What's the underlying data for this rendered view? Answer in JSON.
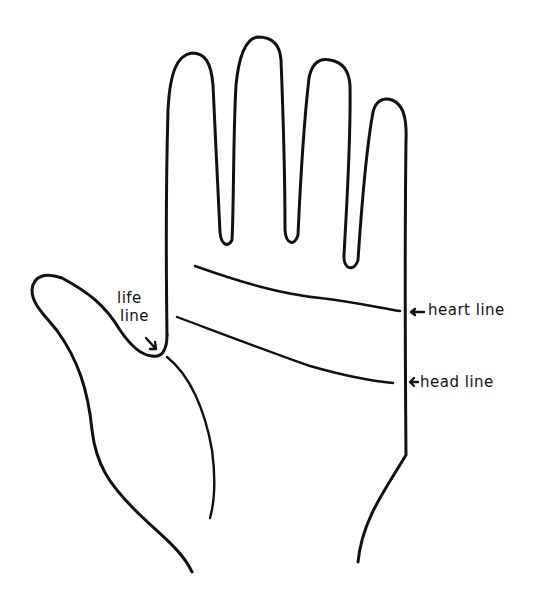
{
  "diagram": {
    "colors": {
      "ink": "#111111",
      "background": "#ffffff"
    },
    "labels": {
      "life_line_1": "life",
      "life_line_2": "line",
      "heart_line": "heart line",
      "head_line": "head line"
    },
    "arrows": {
      "heart_arrow": "←",
      "head_arrow": "←",
      "life_arrow": "↘"
    }
  }
}
